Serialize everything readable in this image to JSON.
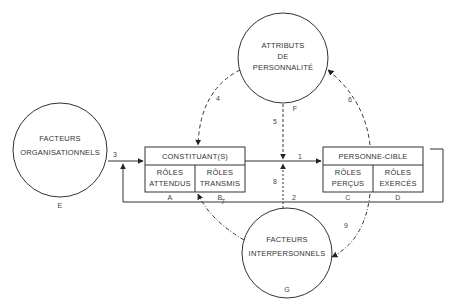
{
  "diagram": {
    "nodes": {
      "E": {
        "lines": [
          "FACTEURS",
          "ORGANISATIONNELS"
        ],
        "letter": "E"
      },
      "F": {
        "lines": [
          "ATTRIBUTS",
          "DE",
          "PERSONNALITÉ"
        ],
        "letter": "F"
      },
      "G": {
        "lines": [
          "FACTEURS",
          "INTERPERSONNELS"
        ],
        "letter": "G"
      },
      "constituant": {
        "title": "CONSTITUANT(S)",
        "cells": [
          {
            "lines": [
              "RÔLES",
              "ATTENDUS"
            ],
            "letter": "A"
          },
          {
            "lines": [
              "RÔLES",
              "TRANSMIS"
            ],
            "letter": "B"
          }
        ]
      },
      "cible": {
        "title": "PERSONNE-CIBLE",
        "cells": [
          {
            "lines": [
              "RÔLES",
              "PERÇUS"
            ],
            "letter": "C"
          },
          {
            "lines": [
              "RÔLES",
              "EXERCÉS"
            ],
            "letter": "D"
          }
        ]
      }
    },
    "edges": {
      "e1": "1",
      "e2": "2",
      "e3": "3",
      "e4": "4",
      "e5": "5",
      "e6": "6",
      "e7": "7",
      "e8": "8",
      "e9": "9"
    }
  }
}
